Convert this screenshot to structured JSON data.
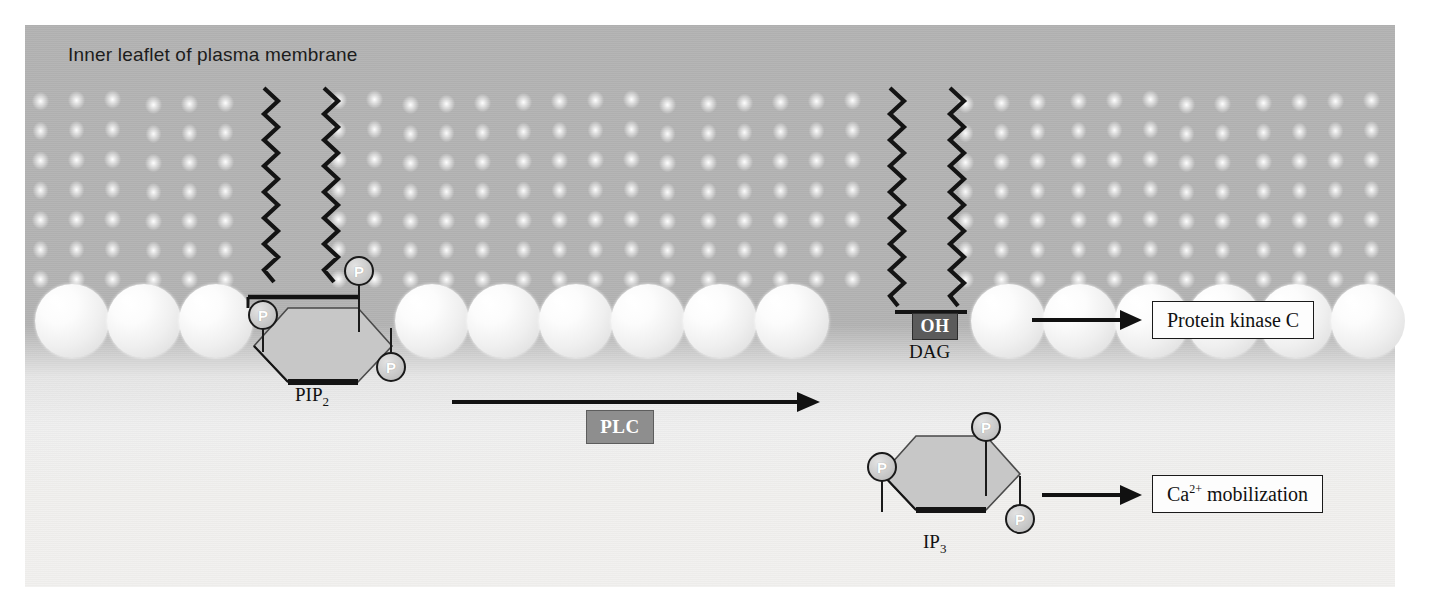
{
  "figure": {
    "title": "Inner leaflet of plasma membrane",
    "type": "biological-signaling-diagram"
  },
  "molecules": {
    "pip2": {
      "label": "PIP",
      "label_sub": "2",
      "phosphate_glyph": "P",
      "phosphate_count": 3,
      "tail_count": 2
    },
    "dag": {
      "label": "DAG",
      "headgroup_label": "OH",
      "tail_count": 2
    },
    "ip3": {
      "label": "IP",
      "label_sub": "3",
      "phosphate_glyph": "P",
      "phosphate_count": 3
    }
  },
  "enzyme": {
    "label": "PLC"
  },
  "outputs": [
    {
      "label": "Protein kinase C",
      "sup": ""
    },
    {
      "label_pre": "Ca",
      "sup": "2+",
      "label_post": " mobilization"
    }
  ],
  "colors": {
    "membrane_gray": "#b3b3b3",
    "cytoplasm": "#f1f0ee",
    "enzyme_box": "#8e8e8e",
    "oh_box": "#5b5b5b",
    "ring_fill": "#c9c9c9",
    "ink": "#1a1a1a"
  }
}
